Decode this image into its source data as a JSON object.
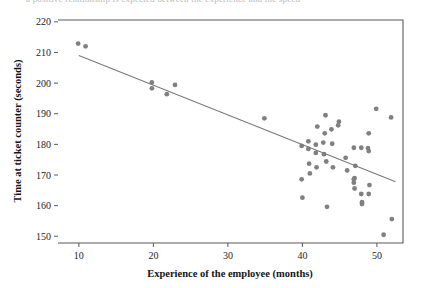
{
  "figure": {
    "top_cut_text": "a positive relationship is expected between the experience and the speed",
    "background_color": "#ffffff"
  },
  "chart_data": {
    "type": "scatter",
    "title": "",
    "xlabel": "Experience of the employee (months)",
    "ylabel": "Time at ticket counter (seconds)",
    "xlim": [
      7.2,
      53.5
    ],
    "ylim": [
      147.8,
      220.6
    ],
    "xticks": [
      10,
      20,
      30,
      40,
      50
    ],
    "yticks": [
      150,
      160,
      170,
      180,
      190,
      200,
      210,
      220
    ],
    "xtick_labels": [
      "10",
      "20",
      "30",
      "40",
      "50"
    ],
    "ytick_labels": [
      "150",
      "160",
      "170",
      "180",
      "190",
      "200",
      "210",
      "220"
    ],
    "grid": false,
    "legend": null,
    "marker_color": "#808080",
    "marker_size": 4.6,
    "line_color": "#7a7a7a",
    "frame_color": "#5a5a5a",
    "series": [
      {
        "name": "Employees",
        "marker": "circle",
        "color": "#808080",
        "points": [
          [
            9.9,
            212.9
          ],
          [
            10.9,
            212.0
          ],
          [
            19.8,
            200.2
          ],
          [
            19.8,
            198.3
          ],
          [
            21.8,
            196.4
          ],
          [
            22.9,
            199.4
          ],
          [
            34.9,
            188.5
          ],
          [
            39.9,
            179.5
          ],
          [
            39.9,
            168.6
          ],
          [
            40.0,
            162.6
          ],
          [
            40.8,
            181.0
          ],
          [
            40.8,
            178.5
          ],
          [
            40.9,
            173.7
          ],
          [
            41.0,
            170.5
          ],
          [
            41.8,
            179.9
          ],
          [
            41.8,
            177.2
          ],
          [
            41.9,
            172.5
          ],
          [
            42.0,
            185.8
          ],
          [
            42.8,
            180.6
          ],
          [
            42.9,
            176.8
          ],
          [
            43.0,
            183.6
          ],
          [
            43.1,
            189.5
          ],
          [
            43.2,
            174.4
          ],
          [
            43.3,
            159.6
          ],
          [
            43.9,
            184.9
          ],
          [
            44.0,
            180.2
          ],
          [
            44.1,
            172.5
          ],
          [
            44.8,
            186.2
          ],
          [
            44.9,
            187.4
          ],
          [
            45.8,
            175.6
          ],
          [
            46.0,
            171.5
          ],
          [
            46.9,
            178.9
          ],
          [
            46.9,
            168.6
          ],
          [
            46.9,
            167.5
          ],
          [
            47.0,
            169.0
          ],
          [
            47.0,
            165.6
          ],
          [
            47.1,
            173.0
          ],
          [
            47.9,
            178.9
          ],
          [
            47.9,
            163.8
          ],
          [
            48.0,
            161.1
          ],
          [
            48.0,
            160.5
          ],
          [
            48.8,
            178.8
          ],
          [
            48.9,
            177.8
          ],
          [
            48.9,
            183.6
          ],
          [
            48.9,
            163.8
          ],
          [
            49.0,
            166.7
          ],
          [
            49.9,
            191.6
          ],
          [
            50.9,
            150.5
          ],
          [
            51.9,
            188.8
          ],
          [
            52.0,
            155.6
          ]
        ]
      }
    ],
    "trendline": {
      "name": "Least-squares fit",
      "color": "#7a7a7a",
      "x_start": 10.0,
      "y_start": 209.0,
      "x_end": 52.5,
      "y_end": 167.8
    }
  }
}
